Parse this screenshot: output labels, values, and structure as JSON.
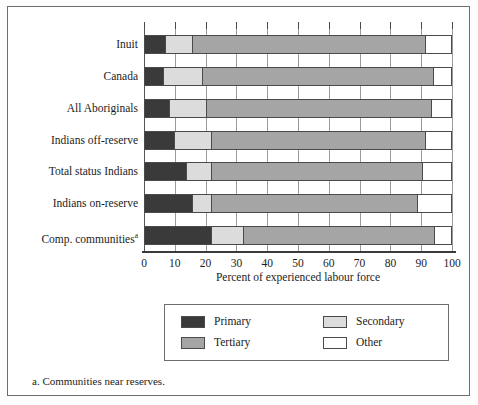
{
  "chart_data": {
    "type": "bar",
    "orientation": "horizontal",
    "stacked": true,
    "title": "",
    "xlabel": "Percent of experienced labour force",
    "ylabel": "",
    "xlim": [
      0,
      100
    ],
    "xticks": [
      0,
      10,
      20,
      30,
      40,
      50,
      60,
      70,
      80,
      90,
      100
    ],
    "xticklabels": [
      "0",
      "10",
      "20",
      "30",
      "40",
      "50",
      "60",
      "70",
      "80",
      "90",
      "100"
    ],
    "grid": true,
    "legend_position": "below",
    "categories": [
      "Inuit",
      "Canada",
      "All Aboriginals",
      "Indians off-reserve",
      "Total status Indians",
      "Indians on-reserve",
      "Comp. communities"
    ],
    "category_footnote_marker": "a",
    "category_footnote_on": "Comp. communities",
    "series": [
      {
        "name": "Primary",
        "color": "#3a3a3a",
        "values": [
          7.0,
          6.5,
          8.5,
          10.0,
          14.0,
          16.0,
          22.0
        ]
      },
      {
        "name": "Secondary",
        "color": "#dcdcdc",
        "values": [
          9.0,
          12.5,
          12.0,
          12.0,
          8.0,
          6.0,
          10.5
        ]
      },
      {
        "name": "Tertiary",
        "color": "#a5a5a5",
        "values": [
          75.5,
          75.0,
          73.0,
          69.5,
          68.5,
          67.0,
          62.0
        ]
      },
      {
        "name": "Other",
        "color": "#ffffff",
        "values": [
          8.5,
          6.0,
          6.5,
          8.5,
          9.5,
          11.0,
          5.5
        ]
      }
    ],
    "cumulative_edges": [
      [
        7.0,
        16.0,
        91.5,
        100.0
      ],
      [
        6.5,
        19.0,
        94.0,
        100.0
      ],
      [
        8.5,
        20.5,
        93.5,
        100.0
      ],
      [
        10.0,
        22.0,
        91.5,
        100.0
      ],
      [
        14.0,
        22.0,
        90.5,
        100.0
      ],
      [
        16.0,
        22.0,
        89.0,
        100.0
      ],
      [
        22.0,
        32.5,
        94.5,
        100.0
      ]
    ],
    "annotations": [
      "a. Communities near reserves."
    ]
  },
  "legend": {
    "entries": [
      {
        "label": "Primary",
        "color": "#3a3a3a"
      },
      {
        "label": "Secondary",
        "color": "#dcdcdc"
      },
      {
        "label": "Tertiary",
        "color": "#a5a5a5"
      },
      {
        "label": "Other",
        "color": "#ffffff"
      }
    ]
  },
  "axis": {
    "x_title": "Percent of experienced labour force"
  },
  "footnote": {
    "text": "a. Communities near reserves."
  },
  "colors": {
    "primary": "#3a3a3a",
    "secondary": "#dcdcdc",
    "tertiary": "#a5a5a5",
    "other": "#ffffff",
    "frame": "#6e6e6e",
    "grid": "#9a9a9a",
    "text": "#1c1c1c"
  }
}
